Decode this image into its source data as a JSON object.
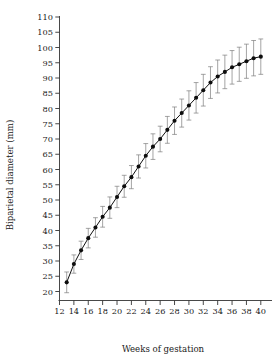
{
  "chart_data": {
    "type": "line",
    "title": "",
    "subtitle": "",
    "xlabel": "Weeks of gestation",
    "ylabel": "Biparietal diameter (mm)",
    "xlim": [
      12,
      41
    ],
    "ylim": [
      20,
      110
    ],
    "grid": false,
    "legend": null,
    "xticks": [
      12,
      14,
      16,
      18,
      20,
      22,
      24,
      26,
      28,
      30,
      32,
      34,
      36,
      38,
      40
    ],
    "yticks": [
      20,
      25,
      30,
      35,
      40,
      45,
      50,
      55,
      60,
      65,
      70,
      75,
      80,
      85,
      90,
      95,
      100,
      105,
      110
    ],
    "marker": "filled-circle",
    "error_bars": "vertical-with-caps",
    "series": [
      {
        "name": "Biparietal diameter",
        "x": [
          13,
          14,
          15,
          16,
          17,
          18,
          19,
          20,
          21,
          22,
          23,
          24,
          25,
          26,
          27,
          28,
          29,
          30,
          31,
          32,
          33,
          34,
          35,
          36,
          37,
          38,
          39,
          40
        ],
        "values": [
          23,
          29,
          33.5,
          37.5,
          41,
          44.5,
          47.5,
          51,
          54.5,
          57.5,
          61,
          64.5,
          67.5,
          70,
          73,
          76,
          78.5,
          81,
          83.5,
          86,
          88.5,
          90.5,
          92,
          93.5,
          94.5,
          95.5,
          96.5,
          97
        ],
        "err_low": [
          3.4,
          3.0,
          3.0,
          3.2,
          3.2,
          3.4,
          3.5,
          3.5,
          3.6,
          3.8,
          3.8,
          4.0,
          4.2,
          4.2,
          4.4,
          4.5,
          4.6,
          4.8,
          5.0,
          5.2,
          5.2,
          5.4,
          5.5,
          5.5,
          5.6,
          5.6,
          5.8,
          5.8
        ],
        "err_high": [
          3.4,
          3.0,
          3.0,
          3.2,
          3.2,
          3.4,
          3.5,
          3.5,
          3.6,
          3.8,
          3.8,
          4.0,
          4.2,
          4.2,
          4.4,
          4.5,
          4.6,
          4.8,
          5.0,
          5.2,
          5.2,
          5.4,
          5.5,
          5.5,
          5.6,
          5.6,
          5.8,
          5.8
        ]
      }
    ],
    "colors": {
      "line": "#111111",
      "marker": "#0d0d0d",
      "error_bar": "#7d7d7d",
      "axis": "#333333",
      "text": "#1a1a1a",
      "background": "#ffffff"
    }
  }
}
